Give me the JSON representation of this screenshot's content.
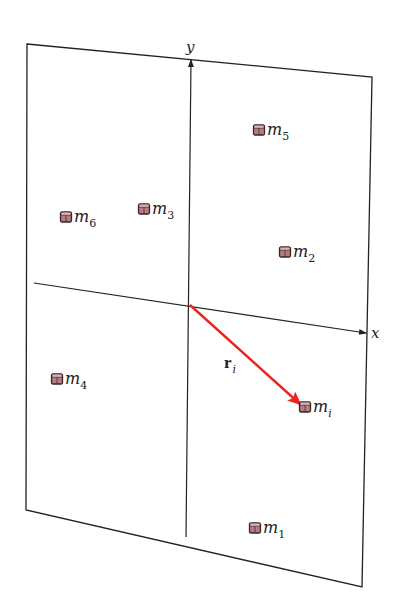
{
  "diagram": {
    "title": "",
    "axes": {
      "x_label": "x",
      "y_label": "y"
    },
    "vector": {
      "label": "r",
      "subscript": "i",
      "color": "#e8241c",
      "from": "origin",
      "to": "m_i"
    },
    "masses": [
      {
        "id": "m5",
        "name": "m",
        "sub": "5",
        "x": 259,
        "y": 130
      },
      {
        "id": "m6",
        "name": "m",
        "sub": "6",
        "x": 66,
        "y": 217
      },
      {
        "id": "m3",
        "name": "m",
        "sub": "3",
        "x": 144,
        "y": 209
      },
      {
        "id": "m2",
        "name": "m",
        "sub": "2",
        "x": 285,
        "y": 252
      },
      {
        "id": "m4",
        "name": "m",
        "sub": "4",
        "x": 57,
        "y": 379
      },
      {
        "id": "mi",
        "name": "m",
        "sub": "i",
        "x": 305,
        "y": 407
      },
      {
        "id": "m1",
        "name": "m",
        "sub": "1",
        "x": 255,
        "y": 528
      }
    ],
    "colors": {
      "cube_face": "#b37d82",
      "cube_top": "#d9b4b7",
      "cube_edge": "#3a2426",
      "line": "#222222"
    }
  }
}
